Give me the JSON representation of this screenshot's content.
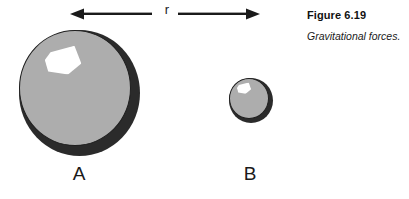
{
  "figure": {
    "caption_title": "Figure 6.19",
    "caption_text": "Gravitational forces.",
    "distance_label": "r",
    "arrow_name": "double-headed-arrow",
    "colors": {
      "background": "#ffffff",
      "sphere_shadow": "#2b2b2b",
      "sphere_face": "#adadad",
      "sphere_outline": "#1f1f1f",
      "highlight": "#ffffff",
      "text": "#1a1a1a",
      "caption_title": "#111111"
    }
  },
  "bodies": [
    {
      "id": "A",
      "label": "A",
      "name": "large-sphere",
      "diameter_px": 121
    },
    {
      "id": "B",
      "label": "B",
      "name": "small-sphere",
      "diameter_px": 44
    }
  ]
}
